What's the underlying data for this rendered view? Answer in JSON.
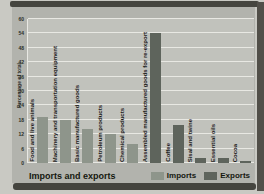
{
  "chart_data": {
    "type": "bar",
    "title": "Imports and exports",
    "ylabel": "Percentage of total",
    "xlabel": "",
    "ylim": [
      0,
      60
    ],
    "yticks": [
      0,
      6,
      12,
      18,
      24,
      30,
      36,
      42,
      48,
      54,
      60
    ],
    "grid": true,
    "legend_position": "bottom-right",
    "categories": [
      "Food and live animals",
      "Machinery and transportation equipment",
      "Basic manufactured goods",
      "Petroleum products",
      "Chemical products",
      "Assembled manufactured goods for re-export",
      "Coffee",
      "Sisal and twine",
      "Essential oils",
      "Cocoa"
    ],
    "values": [
      19,
      18,
      14,
      12,
      8,
      54,
      16,
      2,
      2,
      1
    ],
    "series_membership": [
      "Imports",
      "Imports",
      "Imports",
      "Imports",
      "Imports",
      "Exports",
      "Exports",
      "Exports",
      "Exports",
      "Exports"
    ],
    "series": [
      {
        "name": "Imports",
        "color": "#8e958b"
      },
      {
        "name": "Exports",
        "color": "#5e645c"
      }
    ]
  },
  "footer": {
    "title": "Imports and exports"
  }
}
